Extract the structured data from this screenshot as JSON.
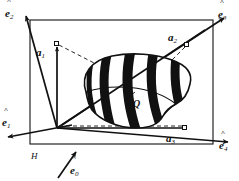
{
  "figure": {
    "background_color": "#ffffff",
    "ink_color": "#111111",
    "stripe_color": "#111111",
    "body_fill_color": "#ffffff"
  },
  "labels": {
    "e0": {
      "base": "e",
      "sub": "0",
      "hat": "˄"
    },
    "e1": {
      "base": "e",
      "sub": "1",
      "hat": "˄"
    },
    "e2": {
      "base": "e",
      "sub": "2",
      "hat": "˄"
    },
    "e3": {
      "base": "e",
      "sub": "3",
      "hat": "˄"
    },
    "e4": {
      "base": "e",
      "sub": "4",
      "hat": "˄"
    },
    "a1": {
      "base": "a",
      "sub": "1"
    },
    "a2": {
      "base": "a",
      "sub": "2"
    },
    "a3": {
      "base": "a",
      "sub": "3"
    },
    "plane": "H",
    "point_q": "Q"
  },
  "geometry": {
    "frame": {
      "x": 30,
      "y": 20,
      "width": 183,
      "height": 124
    },
    "vertex": {
      "x": 57,
      "y": 128
    },
    "markers": [
      {
        "name": "a1",
        "x": 57,
        "y": 44
      },
      {
        "name": "a2",
        "x": 187,
        "y": 44
      },
      {
        "name": "a3",
        "x": 185,
        "y": 128
      }
    ],
    "axes": [
      {
        "name": "e0",
        "from_x": 58,
        "from_y": 178,
        "to_x": 75,
        "to_y": 152
      },
      {
        "name": "e1",
        "from_x": 57,
        "from_y": 128,
        "to_x": 8,
        "to_y": 137
      },
      {
        "name": "e2",
        "from_x": 57,
        "from_y": 128,
        "to_x": 26,
        "to_y": 16
      },
      {
        "name": "e3",
        "from_x": 57,
        "from_y": 128,
        "to_x": 224,
        "to_y": 18
      },
      {
        "name": "e4",
        "from_x": 57,
        "from_y": 128,
        "to_x": 228,
        "to_y": 142
      }
    ]
  }
}
